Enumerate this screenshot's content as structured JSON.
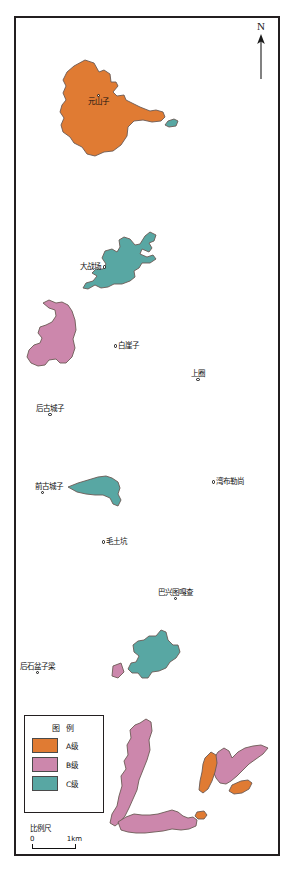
{
  "map": {
    "title": "",
    "north_arrow": {
      "label": "N",
      "icon": "north-arrow-icon"
    },
    "places": [
      {
        "id": "yuanshanzi",
        "name": "元山子",
        "x": 88,
        "y": 94,
        "style": "inside"
      },
      {
        "id": "dazhanchang",
        "name": "大战场",
        "x": 80,
        "y": 262,
        "style": "dot-right"
      },
      {
        "id": "baiyazi",
        "name": "白崖子",
        "x": 114,
        "y": 341,
        "style": "dot-left"
      },
      {
        "id": "shangquan",
        "name": "上圈",
        "x": 191,
        "y": 369,
        "style": "dot-below"
      },
      {
        "id": "hougucheng-zi",
        "name": "后古城子",
        "x": 36,
        "y": 404,
        "style": "dot-below"
      },
      {
        "id": "qiangucheng-zi",
        "name": "前古城子",
        "x": 35,
        "y": 482,
        "style": "dot-below-left"
      },
      {
        "id": "wanbuleshang",
        "name": "湾布勒尚",
        "x": 212,
        "y": 477,
        "style": "dot-left"
      },
      {
        "id": "maotukeng",
        "name": "毛土坑",
        "x": 102,
        "y": 537,
        "style": "dot-left"
      },
      {
        "id": "baxingtu-gacha",
        "name": "巴兴图嘎查",
        "x": 158,
        "y": 588,
        "style": "dot-below"
      },
      {
        "id": "houshipenziliang",
        "name": "后石盆子梁",
        "x": 20,
        "y": 662,
        "style": "dot-below"
      }
    ],
    "legend": {
      "title": "图 例",
      "items": [
        {
          "label": "A级",
          "color": "#E07B33"
        },
        {
          "label": "B级",
          "color": "#CC87AC"
        },
        {
          "label": "C级",
          "color": "#58A7A3"
        }
      ]
    },
    "scale": {
      "title": "比例尺",
      "min_label": "0",
      "max_label": "1km"
    },
    "colors": {
      "grade_a": "#E07B33",
      "grade_b": "#CC87AC",
      "grade_c": "#58A7A3",
      "outline": "#6b5a55",
      "frame": "#231f20",
      "background": "#ffffff"
    },
    "polygons": [
      {
        "id": "poly-a-yuanshanzi",
        "grade": "A级",
        "color": "#E07B33",
        "points": "85,60 94,63 99,72 104,70 110,74 111,82 116,82 118,86 113,92 117,96 124,95 126,100 132,103 140,107 150,111 156,110 163,112 165,117 161,121 152,122 143,120 134,121 128,127 127,136 121,145 113,151 104,152 95,156 87,154 82,147 74,143 70,137 63,132 61,125 64,118 60,112 62,105 66,100 63,93 66,86 63,80 67,72 74,66"
      },
      {
        "id": "poly-c-small-top",
        "grade": "C级",
        "color": "#58A7A3",
        "points": "168,121 174,119 178,121 176,126 169,127 165,125"
      },
      {
        "id": "poly-c-dazhanchang",
        "grade": "C级",
        "color": "#58A7A3",
        "points": "145,236 150,232 156,235 154,241 149,243 152,248 149,252 142,249 140,254 147,257 153,255 156,259 150,263 142,263 139,268 134,271 135,277 130,281 122,284 114,284 108,287 101,288 95,285 88,289 83,288 86,283 93,281 97,276 92,273 96,269 103,269 106,264 102,258 105,251 112,249 117,252 120,247 119,240 124,237 130,239 135,245 140,244"
      },
      {
        "id": "poly-b-west",
        "grade": "B级",
        "color": "#CC87AC",
        "points": "43,303 49,300 56,303 62,302 68,305 72,311 75,320 76,330 73,339 75,348 72,357 66,363 60,363 56,359 49,360 45,365 38,366 31,363 27,357 29,350 34,345 40,343 42,338 38,333 40,327 46,325 52,322 56,316 55,310 49,308"
      },
      {
        "id": "poly-c-qiangucheng",
        "grade": "C级",
        "color": "#58A7A3",
        "points": "68,487 78,483 88,480 98,477 106,476 112,478 118,482 120,488 118,494 121,500 118,506 113,504 110,498 103,495 95,495 86,494 77,492"
      },
      {
        "id": "poly-c-lower",
        "grade": "C级",
        "color": "#58A7A3",
        "points": "156,636 161,630 166,632 168,640 173,645 178,645 180,652 176,658 170,662 166,668 159,671 152,672 148,678 142,678 138,673 132,673 128,669 131,663 136,662 139,656 134,652 133,645 138,641 144,640 149,636"
      },
      {
        "id": "poly-b-tiny-triangle",
        "grade": "B级",
        "color": "#CC87AC",
        "points": "113,666 121,663 124,672 118,678 112,676"
      },
      {
        "id": "poly-b-bottom-left",
        "grade": "B级",
        "color": "#CC87AC",
        "points": "140,723 146,719 151,722 152,731 149,740 150,750 147,760 143,770 139,780 137,790 133,799 129,808 125,816 120,822 115,826 110,823 112,814 117,806 119,796 122,786 121,776 126,769 124,761 128,755 127,745 131,738 130,730 135,725"
      },
      {
        "id": "poly-b-bottom-arm",
        "grade": "B级",
        "color": "#CC87AC",
        "points": "118,822 126,817 134,814 142,815 150,815 158,814 165,812 172,810 178,812 183,816 188,818 193,817 197,820 196,826 189,829 181,830 172,829 163,831 154,832 145,833 136,833 128,832 121,830"
      },
      {
        "id": "poly-b-bottom-right",
        "grade": "B级",
        "color": "#CC87AC",
        "points": "213,760 218,752 224,748 229,751 232,758 238,752 245,748 253,746 261,745 268,748 263,754 256,759 249,764 243,770 237,776 231,781 226,784 220,783 216,778 213,771"
      },
      {
        "id": "poly-a-bottom-right1",
        "grade": "A级",
        "color": "#E07B33",
        "points": "205,758 211,752 216,755 217,763 215,772 212,781 208,789 203,793 199,790 200,781 202,772 203,764"
      },
      {
        "id": "poly-a-bottom-right2",
        "grade": "A级",
        "color": "#E07B33",
        "points": "232,785 241,781 248,780 252,783 249,789 242,793 234,794 229,791"
      },
      {
        "id": "poly-a-bottom-small",
        "grade": "A级",
        "color": "#E07B33",
        "points": "197,812 204,811 207,815 204,819 198,819 195,816"
      }
    ]
  }
}
